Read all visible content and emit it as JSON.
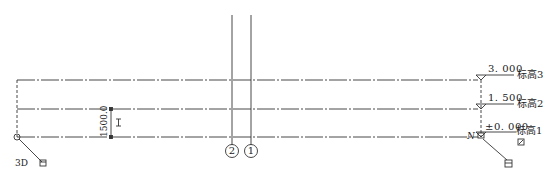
{
  "view": {
    "type": "elevation",
    "label_3d": "3D",
    "north_marker": "N",
    "line_color": "#333333"
  },
  "levels": [
    {
      "name": "标高3",
      "elevation": "3. 000",
      "y": 80
    },
    {
      "name": "标高2",
      "elevation": "1. 500",
      "y": 109
    },
    {
      "name": "标高1",
      "elevation": "±0. 000",
      "y": 137
    }
  ],
  "grids": [
    {
      "name": "2",
      "x": 232
    },
    {
      "name": "1",
      "x": 251
    }
  ],
  "dimension": {
    "value": "1500.0",
    "lock_symbol": "I"
  }
}
